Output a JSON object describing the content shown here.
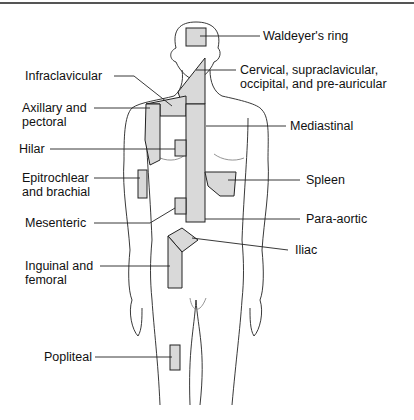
{
  "figure": {
    "shade_color": "#d9d9d9",
    "stroke_color": "#222222",
    "labels": [
      {
        "id": "waldeyer",
        "text": "Waldeyer's ring"
      },
      {
        "id": "cervical",
        "text": "Cervical, supraclavicular,\noccipital, and pre-auricular"
      },
      {
        "id": "infraclavicular",
        "text": "Infraclavicular"
      },
      {
        "id": "axillary",
        "text": "Axillary and\npectoral"
      },
      {
        "id": "mediastinal",
        "text": "Mediastinal"
      },
      {
        "id": "hilar",
        "text": "Hilar"
      },
      {
        "id": "epitrochlear",
        "text": "Epitrochlear\nand brachial"
      },
      {
        "id": "spleen",
        "text": "Spleen"
      },
      {
        "id": "mesenteric",
        "text": "Mesenteric"
      },
      {
        "id": "paraaortic",
        "text": "Para-aortic"
      },
      {
        "id": "iliac",
        "text": "Iliac"
      },
      {
        "id": "inguinal",
        "text": "Inguinal and\nfemoral"
      },
      {
        "id": "popliteal",
        "text": "Popliteal"
      }
    ]
  }
}
